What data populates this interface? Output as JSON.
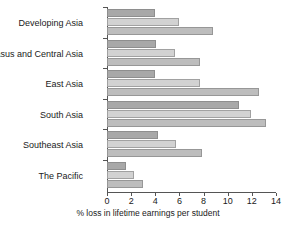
{
  "chart_data": {
    "type": "bar",
    "orientation": "horizontal",
    "title": "",
    "subtitle": "",
    "xlabel": "% loss in lifetime earnings per student",
    "ylabel": "",
    "xlim": [
      0,
      14
    ],
    "xticks": [
      0,
      2,
      4,
      6,
      8,
      10,
      12,
      14
    ],
    "xtick_labels": [
      "0",
      "2",
      "4",
      "6",
      "8",
      "10",
      "12",
      "14"
    ],
    "grid": false,
    "legend": "none",
    "categories": [
      "Developing Asia",
      "Caucasus and Central Asia",
      "East Asia",
      "South Asia",
      "Southeast Asia",
      "The Pacific"
    ],
    "series": [
      {
        "name": "series-1",
        "color": "#a8a8a8",
        "values": [
          4.0,
          4.1,
          4.0,
          10.9,
          4.2,
          1.6
        ]
      },
      {
        "name": "series-2",
        "color": "#d2d2d2",
        "values": [
          6.0,
          5.6,
          7.7,
          11.9,
          5.7,
          2.2
        ]
      },
      {
        "name": "series-3",
        "color": "#bdbdbd",
        "values": [
          8.8,
          7.7,
          12.6,
          13.2,
          7.9,
          3.0
        ]
      }
    ]
  },
  "colors": {
    "axis": "#555555",
    "text": "#1a1a1a",
    "background": "#ffffff",
    "series_1": "#a8a8a8",
    "series_2": "#d2d2d2",
    "series_3": "#bdbdbd"
  }
}
